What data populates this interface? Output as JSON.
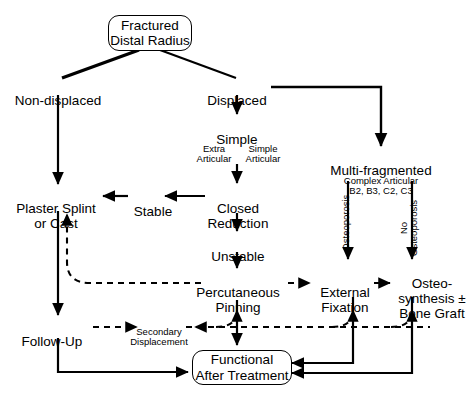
{
  "diagram": {
    "colors": {
      "line": "#000000",
      "background": "#ffffff",
      "text": "#000000"
    },
    "nodes": {
      "root": "Fractured\nDistal Radius",
      "non_displaced": "Non-displaced",
      "displaced": "Displaced",
      "simple": "Simple",
      "simple_sub_left": "Extra\nArticular",
      "simple_sub_right": "Simple\nArticular",
      "multi_fragmented": "Multi-fragmented",
      "multi_sub_line1": "Complex Articular",
      "multi_sub_line2": "B2, B3, C2, C3",
      "plaster": "Plaster Splint\nor Cast",
      "stable": "Stable",
      "closed_reduction": "Closed\nReduction",
      "unstable": "Unstable",
      "percutaneous_pinning": "Percutaneous\nPinning",
      "external_fixation": "External\nFixation",
      "osteosynthesis": "Osteo-\nsynthesis ±\nBone Graft",
      "follow_up": "Follow-Up",
      "secondary_displacement": "Secondary\nDisplacement",
      "functional": "Functional\nAfter Treatment"
    },
    "edge_labels": {
      "osteoporosis": "Osteoporosis",
      "no_osteoporosis": "No\nOsteoporosis"
    }
  }
}
